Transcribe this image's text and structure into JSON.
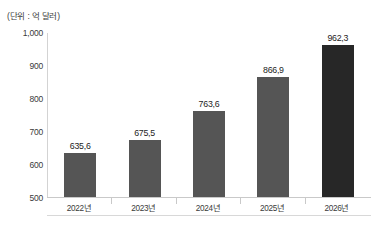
{
  "chart_data": {
    "type": "bar",
    "title": "",
    "subtitle": "",
    "unit_caption": "(단위 : 억 달러)",
    "categories": [
      "2022년",
      "2023년",
      "2024년",
      "2025년",
      "2026년"
    ],
    "values": [
      635.6,
      675.5,
      763.6,
      866.9,
      962.3
    ],
    "value_labels": [
      "635,6",
      "675,5",
      "763,6",
      "866,9",
      "962,3"
    ],
    "xlabel": "",
    "ylabel": "",
    "ylim": [
      500,
      1000
    ],
    "ytick_values": [
      1000,
      900,
      800,
      700,
      600,
      500
    ],
    "ytick_labels": [
      "1,000",
      "900",
      "800",
      "700",
      "600",
      "500"
    ],
    "grid": false,
    "legend": null,
    "series": [
      {
        "name": "",
        "values": [
          635.6,
          675.5,
          763.6,
          866.9,
          962.3
        ],
        "bar_colors": [
          "#555555",
          "#555555",
          "#555555",
          "#555555",
          "#272727"
        ]
      }
    ],
    "colors": {
      "bar_default": "#555555",
      "bar_highlight": "#272727",
      "axis_line": "#c9c9c9",
      "text": "#3a3a3a",
      "value_text": "#1d1d1d",
      "background": "#ffffff"
    }
  }
}
